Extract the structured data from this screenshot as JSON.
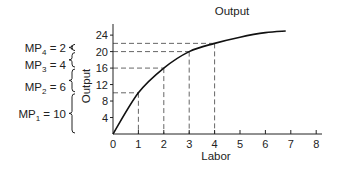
{
  "chart_data": {
    "type": "line",
    "title": "Output",
    "xlabel": "Labor",
    "ylabel": "Output",
    "xlim": [
      0,
      8
    ],
    "ylim": [
      0,
      26
    ],
    "x_ticks": [
      "0",
      "1",
      "2",
      "3",
      "4",
      "5",
      "6",
      "7",
      "8"
    ],
    "y_ticks": [
      "4",
      "8",
      "12",
      "16",
      "20",
      "24"
    ],
    "grid": false,
    "series": [
      {
        "name": "Output",
        "x": [
          0,
          1,
          2,
          3,
          4,
          5,
          6,
          6.8
        ],
        "values": [
          0,
          10,
          16,
          20,
          22,
          23.5,
          24.6,
          25
        ]
      }
    ],
    "reference_points": [
      {
        "labor": 1,
        "output": 10
      },
      {
        "labor": 2,
        "output": 16
      },
      {
        "labor": 3,
        "output": 20
      },
      {
        "labor": 4,
        "output": 22
      }
    ],
    "annotations": [
      {
        "label": "MP",
        "sub": "4",
        "value": "= 2"
      },
      {
        "label": "MP",
        "sub": "3",
        "value": "= 4"
      },
      {
        "label": "MP",
        "sub": "2",
        "value": "= 6"
      },
      {
        "label": "MP",
        "sub": "1",
        "value": "= 10"
      }
    ]
  }
}
